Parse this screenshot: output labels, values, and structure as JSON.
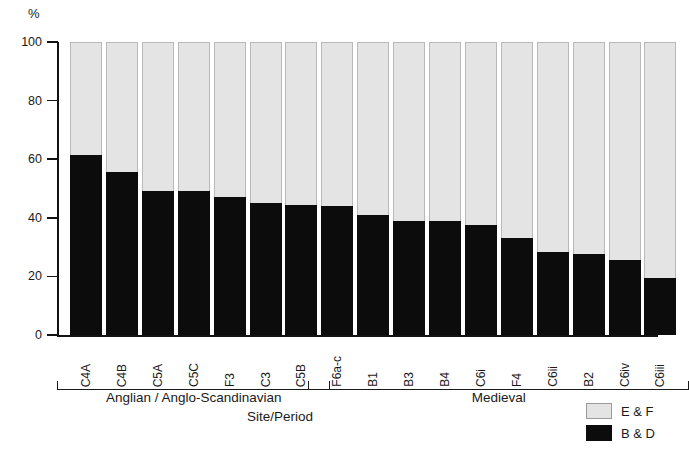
{
  "chart_data": {
    "type": "bar",
    "subtype": "stacked-percentage",
    "title": "",
    "xlabel": "Site/Period",
    "ylabel": "%",
    "ylim": [
      0,
      100
    ],
    "yticks": [
      0,
      20,
      40,
      60,
      80,
      100
    ],
    "ytick_labels": [
      "0",
      "20",
      "40",
      "60",
      "80",
      "100"
    ],
    "grid": false,
    "legend_position": "bottom-right",
    "categories": [
      "C4A",
      "C4B",
      "C5A",
      "C5C",
      "F3",
      "C3",
      "C5B",
      "F6a-c",
      "B1",
      "B3",
      "B4",
      "C6i",
      "F4",
      "C6ii",
      "B2",
      "C6iv",
      "C6iii"
    ],
    "series": [
      {
        "name": "B & D",
        "color": "#0c0c0c",
        "values": [
          61.5,
          55.5,
          49.0,
          49.0,
          47.0,
          45.0,
          44.5,
          44.0,
          41.0,
          39.0,
          39.0,
          37.5,
          33.0,
          28.5,
          27.5,
          25.5,
          19.5
        ]
      },
      {
        "name": "E & F",
        "color": "#e4e4e4",
        "values": [
          38.5,
          44.5,
          51.0,
          51.0,
          53.0,
          55.0,
          55.5,
          56.0,
          59.0,
          61.0,
          61.0,
          62.5,
          67.0,
          71.5,
          72.5,
          74.5,
          80.5
        ]
      }
    ],
    "groups": [
      {
        "label": "Anglian / Anglo-Scandinavian",
        "start": 0,
        "end": 6
      },
      {
        "label": "Medieval",
        "start": 7,
        "end": 16
      }
    ]
  },
  "legend": {
    "items": [
      {
        "label": "E & F",
        "swatch": "light-gray-swatch"
      },
      {
        "label": "B & D",
        "swatch": "black-swatch"
      }
    ]
  }
}
